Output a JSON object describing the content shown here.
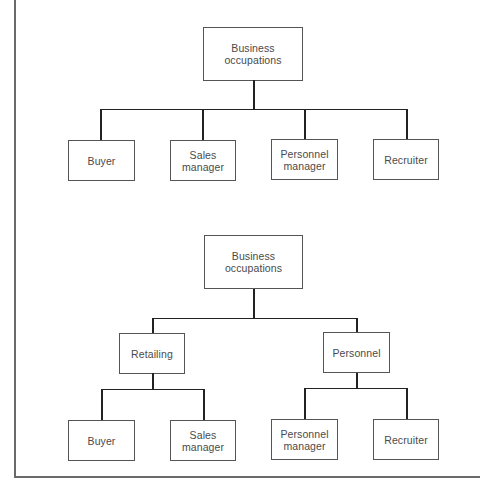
{
  "diagram": {
    "type": "tree",
    "trees": [
      {
        "name": "flat-hierarchy",
        "root": "Business\noccupations",
        "children": [
          "Buyer",
          "Sales\nmanager",
          "Personnel\nmanager",
          "Recruiter"
        ]
      },
      {
        "name": "nested-hierarchy",
        "root": "Business\noccupations",
        "categories": [
          {
            "label": "Retailing",
            "children": [
              "Buyer",
              "Sales\nmanager"
            ]
          },
          {
            "label": "Personnel",
            "children": [
              "Personnel\nmanager",
              "Recruiter"
            ]
          }
        ]
      }
    ]
  },
  "top": {
    "root": "Business\noccupations",
    "leaves": [
      "Buyer",
      "Sales\nmanager",
      "Personnel\nmanager",
      "Recruiter"
    ]
  },
  "bottom": {
    "root": "Business\noccupations",
    "mid": [
      "Retailing",
      "Personnel"
    ],
    "leaves": [
      "Buyer",
      "Sales\nmanager",
      "Personnel\nmanager",
      "Recruiter"
    ]
  },
  "colors": {
    "line": "#222222",
    "box_border": "#555555",
    "text": "#4a4a4a",
    "frame": "#6a6a6a"
  }
}
